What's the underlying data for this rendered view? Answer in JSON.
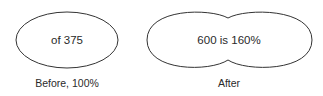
{
  "before": {
    "shape_text": "of 375",
    "caption": "Before, 100%"
  },
  "after": {
    "shape_text": "600 is 160%",
    "caption": "After"
  },
  "colors": {
    "stroke": "#333333",
    "text": "#2a2a2a",
    "background": "#ffffff"
  }
}
